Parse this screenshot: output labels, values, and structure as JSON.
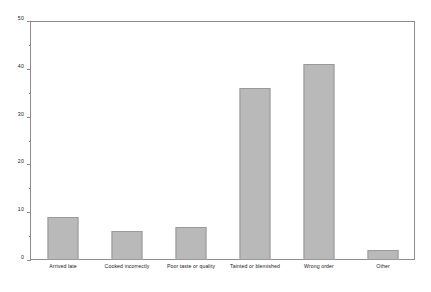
{
  "chart_data": {
    "type": "bar",
    "title": "",
    "xlabel": "",
    "ylabel": "",
    "categories": [
      "Arrived late",
      "Cooked incorrectly",
      "Poor taste or quality",
      "Tainted or blemished",
      "Wrong order",
      "Other"
    ],
    "values": [
      9,
      6,
      7,
      36,
      41,
      2
    ],
    "ylim": [
      0,
      50
    ],
    "y_major_ticks": [
      0,
      10,
      20,
      30,
      40,
      50
    ],
    "y_minor_ticks": [
      5,
      15,
      25,
      35,
      45
    ],
    "y_tick_labels": [
      "0",
      "10",
      "20",
      "30",
      "40",
      "50"
    ],
    "grid": false,
    "legend": false,
    "bar_color": "#b9b9b9",
    "bar_border_color": "#9a9a9a",
    "axis_color": "#8c8c8c",
    "background_color": "#ffffff",
    "text_color": "#1a1a1a"
  }
}
